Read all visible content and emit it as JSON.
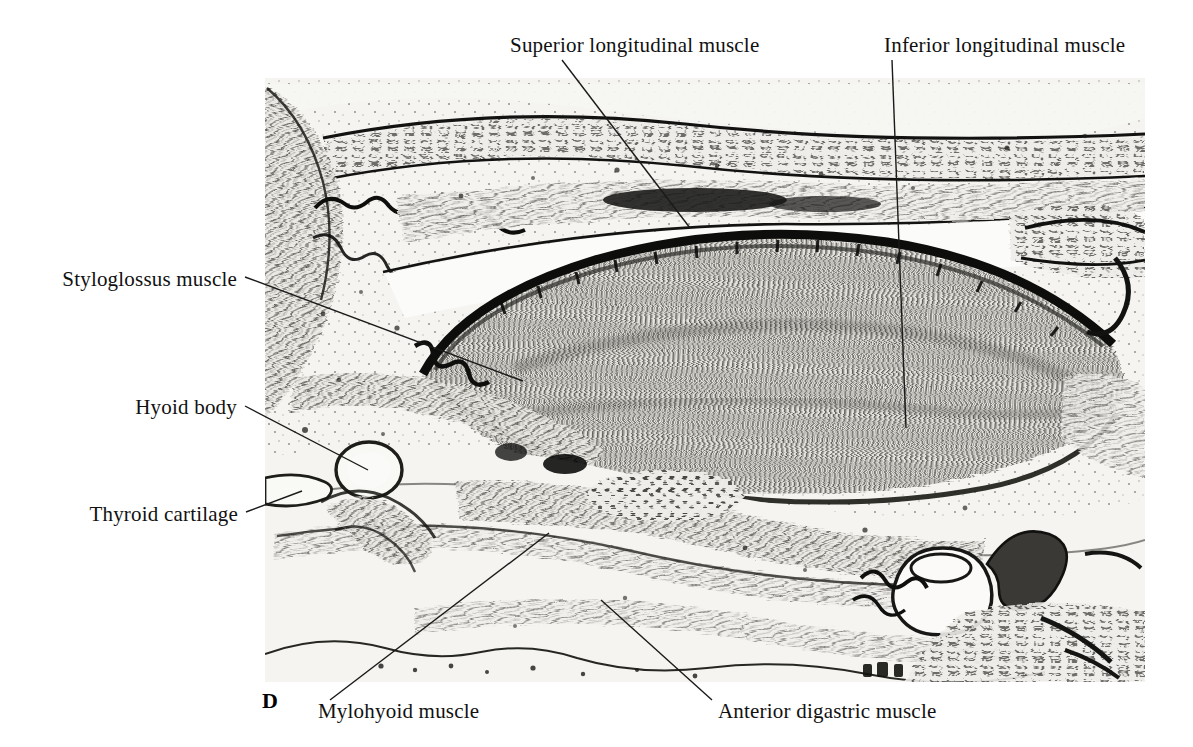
{
  "figure": {
    "panel_letter": "D",
    "panel_letter_pos": {
      "x": 262,
      "y": 688
    },
    "image_bounds": {
      "x": 265,
      "y": 78,
      "width": 880,
      "height": 604
    },
    "modality": "histological-section-micrograph",
    "orientation": "sagittal",
    "stain_tone": "grayscale",
    "background_color": "#ffffff",
    "tissue_base_color": "#f3f2ef",
    "ink_color": "#141414",
    "leader_color": "#1a1a1a"
  },
  "labels": [
    {
      "id": "superior-longitudinal-muscle",
      "text": "Superior longitudinal muscle",
      "text_x": 510,
      "text_y": 50,
      "anchor": "start",
      "leader": {
        "x1": 562,
        "y1": 60,
        "x2": 690,
        "y2": 228
      }
    },
    {
      "id": "inferior-longitudinal-muscle",
      "text": "Inferior longitudinal muscle",
      "text_x": 884,
      "text_y": 50,
      "anchor": "start",
      "leader": {
        "x1": 892,
        "y1": 60,
        "x2": 906,
        "y2": 428
      }
    },
    {
      "id": "styloglossus-muscle",
      "text": "Styloglossus muscle",
      "text_x": 237,
      "text_y": 284,
      "anchor": "end",
      "leader": {
        "x1": 245,
        "y1": 277,
        "x2": 523,
        "y2": 381
      }
    },
    {
      "id": "hyoid-body",
      "text": "Hyoid body",
      "text_x": 237,
      "text_y": 412,
      "anchor": "end",
      "leader": {
        "x1": 245,
        "y1": 406,
        "x2": 368,
        "y2": 470
      }
    },
    {
      "id": "thyroid-cartilage",
      "text": "Thyroid cartilage",
      "text_x": 238,
      "text_y": 519,
      "anchor": "end",
      "leader": {
        "x1": 246,
        "y1": 512,
        "x2": 302,
        "y2": 491
      }
    },
    {
      "id": "mylohyoid-muscle",
      "text": "Mylohyoid muscle",
      "text_x": 318,
      "text_y": 716,
      "anchor": "start",
      "leader": {
        "x1": 330,
        "y1": 700,
        "x2": 549,
        "y2": 533
      }
    },
    {
      "id": "anterior-digastric-muscle",
      "text": "Anterior digastric muscle",
      "text_x": 718,
      "text_y": 716,
      "anchor": "start",
      "leader": {
        "x1": 712,
        "y1": 700,
        "x2": 601,
        "y2": 600
      }
    }
  ],
  "structures": [
    {
      "id": "tongue-body",
      "note": "large lens-shaped mass of vertical muscle fibers, center of field"
    },
    {
      "id": "dorsal-epithelium",
      "note": "dark keratinized band over superior tongue surface"
    },
    {
      "id": "hard-palate",
      "note": "horizontal bony plate above tongue, upper left to upper right"
    },
    {
      "id": "hyoid-body-ossicle",
      "note": "pale oval cartilage, lower left"
    },
    {
      "id": "thyroid-cartilage-plate",
      "note": "pale elongated plate, far lower left"
    },
    {
      "id": "mandible-tooth-germs",
      "note": "pale bulbous tooth germs, lower right"
    },
    {
      "id": "mylohyoid-sheet",
      "note": "thin fibrous sheet running lower-left to mid-field"
    },
    {
      "id": "anterior-digastric-belly",
      "note": "fiber bundle below mylohyoid, lower center"
    }
  ]
}
